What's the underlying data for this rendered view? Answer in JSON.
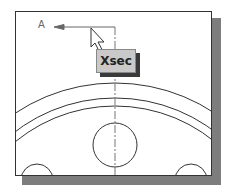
{
  "diagram": {
    "section_label": "A",
    "button": {
      "label": "Xsec"
    },
    "icons": {
      "cursor": "arrow-pointer-icon"
    },
    "colors": {
      "line": "#333333",
      "shadow": "#7d7d7d",
      "button_bg": "#c9c9c9"
    }
  }
}
